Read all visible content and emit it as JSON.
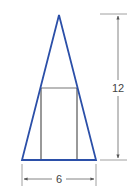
{
  "diagram": {
    "triangle": {
      "apex": [
        59,
        15
      ],
      "base_left": [
        22,
        160
      ],
      "base_right": [
        96,
        160
      ],
      "color": "#2b4fa8"
    },
    "rectangle": {
      "x_left": 41,
      "x_right": 77,
      "y_top": 88,
      "y_bottom": 160,
      "color": "#555555"
    },
    "dimensions": {
      "height_label": "12",
      "base_label": "6"
    },
    "colors": {
      "shape": "#2b4fa8",
      "dimension": "#666666",
      "rectangle": "#555555"
    }
  }
}
